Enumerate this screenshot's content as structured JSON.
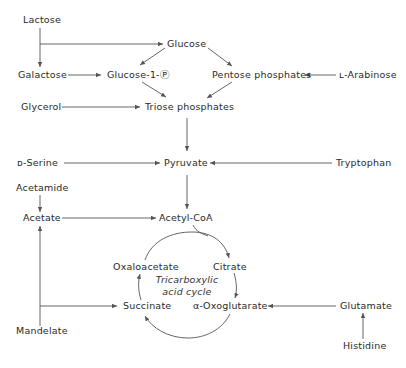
{
  "diagram": {
    "nodes": {
      "lactose": "Lactose",
      "glucose": "Glucose",
      "galactose": "Galactose",
      "glucose1p": "Glucose-1-Ⓟ",
      "pentose": "Pentose phosphates",
      "arabinose": "ʟ-Arabinose",
      "glycerol": "Glycerol",
      "triose": "Triose phosphates",
      "serine": "ᴅ-Serine",
      "pyruvate": "Pyruvate",
      "tryptophan": "Tryptophan",
      "acetamide": "Acetamide",
      "acetate": "Acetate",
      "acetylcoa": "Acetyl-CoA",
      "oxaloacetate": "Oxaloacetate",
      "citrate": "Citrate",
      "cycle_line1": "Tricarboxylic",
      "cycle_line2": "acid cycle",
      "succinate": "Succinate",
      "oxoglutarate": "α-Oxoglutarate",
      "glutamate": "Glutamate",
      "mandelate": "Mandelate",
      "histidine": "Histidine"
    },
    "edges": [
      {
        "from": "Lactose",
        "to": "Glucose"
      },
      {
        "from": "Lactose",
        "to": "Galactose"
      },
      {
        "from": "Galactose",
        "to": "Glucose-1-P"
      },
      {
        "from": "Glucose",
        "to": "Glucose-1-P"
      },
      {
        "from": "Glucose",
        "to": "Pentose phosphates"
      },
      {
        "from": "L-Arabinose",
        "to": "Pentose phosphates"
      },
      {
        "from": "Glucose-1-P",
        "to": "Triose phosphates"
      },
      {
        "from": "Pentose phosphates",
        "to": "Triose phosphates"
      },
      {
        "from": "Glycerol",
        "to": "Triose phosphates"
      },
      {
        "from": "Triose phosphates",
        "to": "Pyruvate"
      },
      {
        "from": "D-Serine",
        "to": "Pyruvate"
      },
      {
        "from": "Tryptophan",
        "to": "Pyruvate"
      },
      {
        "from": "Pyruvate",
        "to": "Acetyl-CoA"
      },
      {
        "from": "Acetamide",
        "to": "Acetate"
      },
      {
        "from": "Mandelate",
        "to": "Acetate"
      },
      {
        "from": "Mandelate",
        "to": "Succinate"
      },
      {
        "from": "Acetate",
        "to": "Acetyl-CoA"
      },
      {
        "from": "Acetyl-CoA",
        "to": "Citrate"
      },
      {
        "from": "Citrate",
        "to": "α-Oxoglutarate"
      },
      {
        "from": "α-Oxoglutarate",
        "to": "Succinate"
      },
      {
        "from": "Succinate",
        "to": "Oxaloacetate"
      },
      {
        "from": "Oxaloacetate",
        "to": "Citrate"
      },
      {
        "from": "Glutamate",
        "to": "α-Oxoglutarate"
      },
      {
        "from": "Histidine",
        "to": "Glutamate"
      }
    ]
  }
}
